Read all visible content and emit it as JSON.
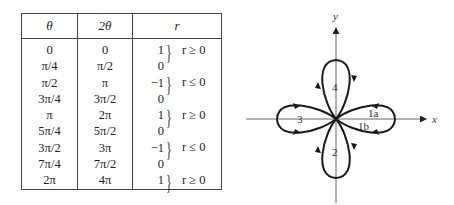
{
  "table": {
    "headers": [
      "θ",
      "2θ",
      "r"
    ],
    "rows": [
      {
        "theta": "0",
        "two_theta": "0",
        "r": "1"
      },
      {
        "theta": "π/4",
        "two_theta": "π/2",
        "r": "0"
      },
      {
        "theta": "π/2",
        "two_theta": "π",
        "r": "−1"
      },
      {
        "theta": "3π/4",
        "two_theta": "3π/2",
        "r": "0"
      },
      {
        "theta": "π",
        "two_theta": "2π",
        "r": "1"
      },
      {
        "theta": "5π/4",
        "two_theta": "5π/2",
        "r": "0"
      },
      {
        "theta": "3π/2",
        "two_theta": "3π",
        "r": "−1"
      },
      {
        "theta": "7π/4",
        "two_theta": "7π/2",
        "r": "0"
      },
      {
        "theta": "2π",
        "two_theta": "4π",
        "r": "1"
      }
    ],
    "conditions": [
      {
        "label": "r ≥ 0"
      },
      {
        "label": "r ≤ 0"
      },
      {
        "label": "r ≥ 0"
      },
      {
        "label": "r ≤ 0"
      },
      {
        "label": "r ≥ 0"
      }
    ]
  },
  "graph": {
    "x_axis_label": "x",
    "y_axis_label": "y",
    "petal_labels": [
      "1a",
      "1b",
      "2",
      "3",
      "4"
    ],
    "curve": "r = cos 2θ (four-leaved rose)"
  }
}
